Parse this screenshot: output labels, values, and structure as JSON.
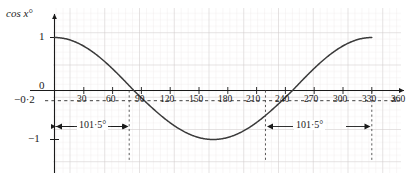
{
  "chart_data": {
    "type": "line",
    "title": "",
    "xlabel": "x",
    "ylabel": "cos x°",
    "xlim": [
      -20,
      380
    ],
    "ylim": [
      -1.35,
      1.3
    ],
    "grid": true,
    "legend": "none",
    "function": "y = cos x°",
    "x_ticks": [
      "30",
      "60",
      "90",
      "120",
      "150",
      "180",
      "210",
      "240",
      "270",
      "300",
      "330",
      "360"
    ],
    "x_tick_values": [
      30,
      60,
      90,
      120,
      150,
      180,
      210,
      240,
      270,
      300,
      330,
      360
    ],
    "y_ticks": [
      "1",
      "0",
      "−0·2",
      "−1"
    ],
    "y_tick_values": [
      1,
      0,
      -0.2,
      -1
    ],
    "x": [
      0,
      10,
      20,
      30,
      40,
      50,
      60,
      70,
      80,
      90,
      100,
      110,
      120,
      130,
      140,
      150,
      160,
      170,
      180,
      190,
      200,
      210,
      220,
      230,
      240,
      250,
      260,
      270,
      280,
      290,
      300,
      310,
      320,
      330,
      340,
      350,
      360
    ],
    "y": [
      1,
      0.985,
      0.94,
      0.866,
      0.766,
      0.643,
      0.5,
      0.342,
      0.174,
      0,
      -0.174,
      -0.342,
      -0.5,
      -0.643,
      -0.766,
      -0.866,
      -0.94,
      -0.985,
      -1,
      -0.985,
      -0.94,
      -0.866,
      -0.766,
      -0.643,
      -0.5,
      -0.342,
      -0.174,
      0,
      0.174,
      0.342,
      0.5,
      0.643,
      0.766,
      0.866,
      0.94,
      0.985,
      1
    ],
    "annotations": [
      {
        "name": "left-span",
        "label": "101·5°",
        "from_x": 0,
        "to_x": 101.5,
        "at_y": -0.72
      },
      {
        "name": "right-span",
        "label": "101·5°",
        "from_x": 258.5,
        "to_x": 360,
        "at_y": -0.72
      }
    ],
    "guide_lines": [
      {
        "name": "guide-101-5",
        "x": 101.5
      },
      {
        "name": "guide-258-5",
        "x": 258.5
      },
      {
        "name": "guide-360",
        "x": 360
      }
    ],
    "reference_line": {
      "name": "y-minus-0-2",
      "y": -0.2,
      "style": "dashed"
    },
    "colors": {
      "curve": "#3a3a3a",
      "axis": "#1a1a1a",
      "grid_minor": "#e8e3e3",
      "grid_major": "#cdc8c8",
      "text": "#1a1a1a",
      "guide": "#555555"
    }
  },
  "axes": {
    "y_title": "cos x°",
    "x_title": "x"
  },
  "y_labels": {
    "one": "1",
    "zero": "0",
    "neg_zero_two": "−0·2",
    "neg_one": "−1"
  },
  "x_labels": {
    "t30": "30",
    "t60": "60",
    "t90": "90",
    "t120": "120",
    "t150": "150",
    "t180": "180",
    "t210": "210",
    "t240": "240",
    "t270": "270",
    "t300": "300",
    "t330": "330",
    "t360": "360"
  },
  "annotations": {
    "left_span_label": "101·5°",
    "right_span_label": "101·5°"
  }
}
